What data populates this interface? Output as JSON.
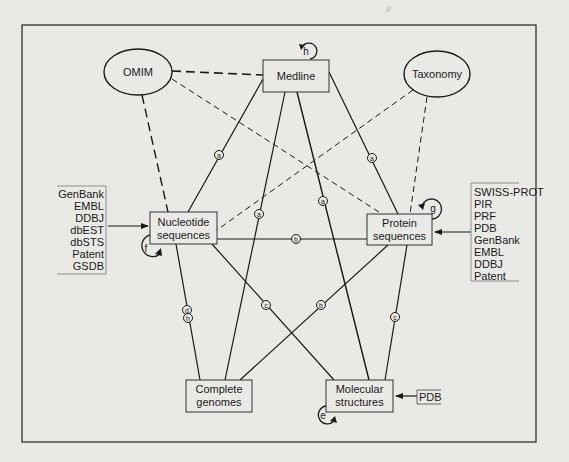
{
  "diagram": {
    "stray_mark": "//",
    "nodes": {
      "omim": {
        "label": "OMIM",
        "shape": "ellipse"
      },
      "medline": {
        "label": "Medline",
        "shape": "box"
      },
      "taxonomy": {
        "label": "Taxonomy",
        "shape": "ellipse"
      },
      "nucleotide": {
        "line1": "Nucleotide",
        "line2": "sequences",
        "shape": "box"
      },
      "protein": {
        "line1": "Protein",
        "line2": "sequences",
        "shape": "box"
      },
      "genomes": {
        "line1": "Complete",
        "line2": "genomes",
        "shape": "box"
      },
      "structures": {
        "line1": "Molecular",
        "line2": "structures",
        "shape": "box"
      }
    },
    "sources": {
      "nucleotide": [
        "GenBank",
        "EMBL",
        "DDBJ",
        "dbEST",
        "dbSTS",
        "Patent",
        "GSDB"
      ],
      "protein": [
        "SWISS-PROT",
        "PIR",
        "PRF",
        "PDB",
        "GenBank",
        "EMBL",
        "DDBJ",
        "Patent"
      ],
      "structures": [
        "PDB"
      ]
    },
    "self_loops": {
      "medline": "h",
      "nucleotide": "f",
      "protein": "g",
      "structures": "e"
    },
    "edge_labels": {
      "medline_nucleotide": "a",
      "medline_genomes": "a",
      "medline_structures": "a",
      "medline_protein": "a",
      "nucleotide_protein": "b",
      "protein_genomes": "b",
      "nucleotide_structures": "c",
      "protein_structures": "c",
      "nucleotide_genomes_1": "d",
      "nucleotide_genomes_2": "h"
    },
    "edges": [
      {
        "from": "OMIM",
        "to": "Medline",
        "style": "long-dash"
      },
      {
        "from": "OMIM",
        "to": "Nucleotide sequences",
        "style": "long-dash"
      },
      {
        "from": "OMIM",
        "to": "Protein sequences",
        "style": "short-dash"
      },
      {
        "from": "Taxonomy",
        "to": "Nucleotide sequences",
        "style": "short-dash"
      },
      {
        "from": "Taxonomy",
        "to": "Protein sequences",
        "style": "short-dash"
      },
      {
        "from": "Medline",
        "to": "Nucleotide sequences",
        "style": "solid",
        "label": "a"
      },
      {
        "from": "Medline",
        "to": "Complete genomes",
        "style": "solid",
        "label": "a"
      },
      {
        "from": "Medline",
        "to": "Molecular structures",
        "style": "solid",
        "label": "a"
      },
      {
        "from": "Medline",
        "to": "Protein sequences",
        "style": "solid",
        "label": "a"
      },
      {
        "from": "Nucleotide sequences",
        "to": "Protein sequences",
        "style": "solid",
        "label": "b"
      },
      {
        "from": "Protein sequences",
        "to": "Complete genomes",
        "style": "solid",
        "label": "b"
      },
      {
        "from": "Nucleotide sequences",
        "to": "Molecular structures",
        "style": "solid",
        "label": "c"
      },
      {
        "from": "Protein sequences",
        "to": "Molecular structures",
        "style": "solid",
        "label": "c"
      },
      {
        "from": "Nucleotide sequences",
        "to": "Complete genomes",
        "style": "solid",
        "label": "d, h"
      }
    ]
  }
}
